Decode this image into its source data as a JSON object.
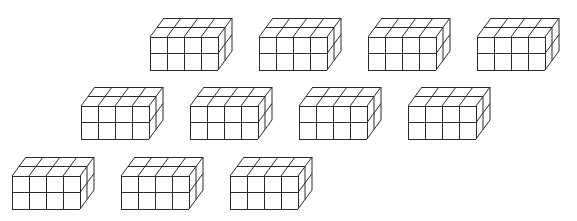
{
  "figure": {
    "background": "#ffffff",
    "line_color": "#2a2a2a",
    "prism": {
      "width_cubes": 4,
      "height_cubes": 2,
      "depth_cubes": 2,
      "cell_width_px": 17,
      "cell_height_px": 16.5,
      "depth_dx_per_cube_px": 7,
      "depth_dy_per_cube_px": -9.5
    },
    "rows": [
      {
        "row": 1,
        "front_top_y": 37,
        "front_left_x": [
          150,
          259,
          368,
          477
        ]
      },
      {
        "row": 2,
        "front_top_y": 106,
        "front_left_x": [
          81,
          190,
          299,
          408
        ]
      },
      {
        "row": 3,
        "front_top_y": 176,
        "front_left_x": [
          12,
          121,
          230
        ]
      }
    ],
    "count": 11
  }
}
